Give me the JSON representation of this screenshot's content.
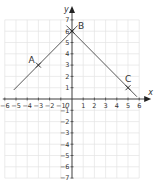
{
  "axes": {
    "x_label": "x",
    "y_label": "y",
    "x_min": -6,
    "x_max": 6,
    "y_min": -7,
    "y_max": 7,
    "origin_label": "0"
  },
  "x_ticks": [
    "-6",
    "-5",
    "-4",
    "-3",
    "-2",
    "-1",
    "1",
    "2",
    "3",
    "4",
    "5",
    "6"
  ],
  "y_ticks": [
    "7",
    "6",
    "5",
    "4",
    "3",
    "2",
    "1",
    "-1",
    "-2",
    "-3",
    "-4",
    "-5",
    "-6",
    "-7"
  ],
  "points": [
    {
      "label": "A",
      "x": -3,
      "y": 3
    },
    {
      "label": "B",
      "x": 0,
      "y": 6
    },
    {
      "label": "C",
      "x": 5,
      "y": 1
    }
  ],
  "lines": [
    {
      "from": [
        -5.2,
        0.8
      ],
      "to": [
        0.5,
        6.5
      ]
    },
    {
      "from": [
        -0.5,
        6.5
      ],
      "to": [
        5.8,
        0.2
      ]
    }
  ]
}
